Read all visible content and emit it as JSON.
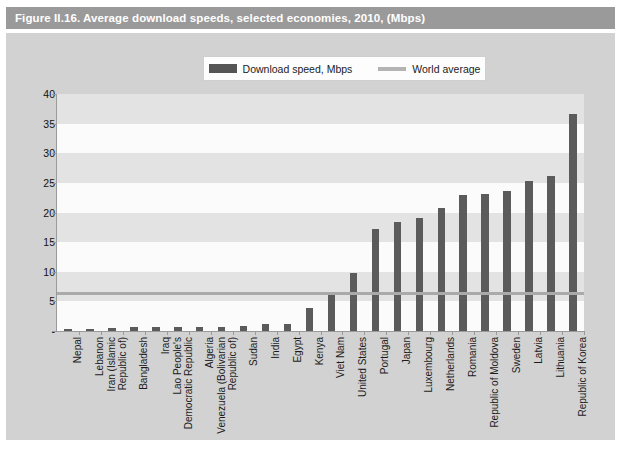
{
  "figure": {
    "title": "Figure II.16.   Average download speeds, selected economies, 2010, (Mbps)"
  },
  "legend": {
    "items": [
      {
        "label": "Download speed, Mbps",
        "marker": "bar-swatch",
        "color": "#5b5b5b"
      },
      {
        "label": "World average",
        "marker": "line-swatch",
        "color": "#b4b4b4"
      }
    ]
  },
  "colors": {
    "title_bar": "#9a9a9a",
    "panel": "#d2d2d2",
    "plot_bg": "#fbfbfb",
    "band": "#e3e3e3",
    "bar": "#5b5b5b",
    "average_line": "#aaaaaa",
    "axis": "#9a9a9a"
  },
  "chart_data": {
    "type": "bar",
    "title": "Average download speeds, selected economies, 2010, (Mbps)",
    "xlabel": "",
    "ylabel": "",
    "ylim": [
      0,
      40
    ],
    "yticks": [
      "-",
      "5",
      "10",
      "15",
      "20",
      "25",
      "30",
      "35",
      "40"
    ],
    "ytick_values": [
      0,
      5,
      10,
      15,
      20,
      25,
      30,
      35,
      40
    ],
    "grid": "horizontal-bands",
    "legend_position": "top-center",
    "categories": [
      "Nepal",
      "Lebanon",
      "Iran (Islamic Republic of)",
      "Bangladesh",
      "Iraq",
      "Lao People's Democratic Republic",
      "Algeria",
      "Venezuela (Bolivarian Republic of)",
      "Sudan",
      "India",
      "Egypt",
      "Kenya",
      "Viet Nam",
      "United States",
      "Portugal",
      "Japan",
      "Luxembourg",
      "Netherlands",
      "Romania",
      "Republic of Moldova",
      "Sweden",
      "Latvia",
      "Lithuania",
      "Republic of Korea"
    ],
    "series": [
      {
        "name": "Download speed, Mbps",
        "values": [
          0.3,
          0.4,
          0.5,
          0.6,
          0.6,
          0.6,
          0.7,
          0.7,
          0.8,
          1.1,
          1.2,
          3.9,
          6.6,
          9.8,
          17.2,
          18.4,
          19.1,
          20.8,
          22.9,
          23.2,
          23.7,
          25.3,
          26.1,
          36.6
        ]
      }
    ],
    "reference_line": {
      "name": "World average",
      "value": 6.4,
      "orientation": "horizontal"
    }
  },
  "footer": {
    "note": ""
  }
}
